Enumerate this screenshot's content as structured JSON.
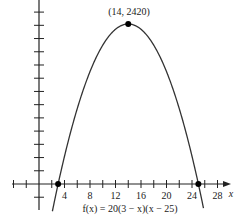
{
  "chart_data": {
    "type": "line",
    "title": "",
    "function_label": "f(x) = 20(3 − x)(x − 25)",
    "xlabel": "x",
    "ylabel": "",
    "x_ticks": [
      4,
      8,
      12,
      16,
      20,
      24,
      28
    ],
    "x_tick_step": 2,
    "y_tick_step": 200,
    "xlim": [
      -6,
      30
    ],
    "ylim": [
      -200,
      2700
    ],
    "grid": false,
    "series": [
      {
        "name": "f(x) = 20(3 − x)(x − 25)",
        "x": [
          2,
          3,
          5,
          8,
          11,
          14,
          17,
          20,
          23,
          25,
          26
        ],
        "y": [
          -460,
          0,
          800,
          1700,
          2240,
          2420,
          2240,
          1700,
          800,
          0,
          -460
        ]
      }
    ],
    "points": [
      {
        "x": 3,
        "y": 0,
        "label": ""
      },
      {
        "x": 14,
        "y": 2420,
        "label": "(14, 2420)"
      },
      {
        "x": 25,
        "y": 0,
        "label": ""
      }
    ],
    "annotations": [
      "(14, 2420)",
      "f(x) = 20(3 − x)(x − 25)"
    ]
  },
  "labels": {
    "vertex": "(14, 2420)",
    "x_axis": "x",
    "function": "f(x) = 20(3 − x)(x − 25)",
    "ticks": [
      "4",
      "8",
      "12",
      "16",
      "20",
      "24",
      "28"
    ]
  }
}
